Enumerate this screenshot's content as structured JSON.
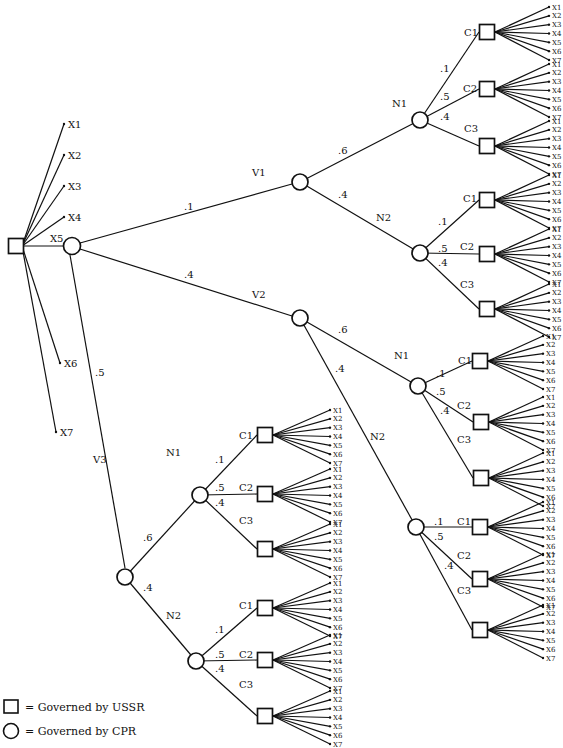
{
  "diagram": {
    "type": "decision-tree",
    "root": {
      "shape": "square",
      "governed_by": "USSR",
      "branches_to_outcomes": [
        "X1",
        "X2",
        "X3",
        "X4",
        "X6",
        "X7"
      ],
      "x5_label": "X5"
    },
    "level1_circle": {
      "shape": "circle",
      "governed_by": "CPR"
    },
    "v_branches": [
      {
        "label": "V1",
        "prob": ".1",
        "n_branches": [
          {
            "label": "N1",
            "prob": ".6",
            "c_branches": [
              {
                "label": "C1",
                "prob": ".1",
                "outcomes": [
                  "X1",
                  "X2",
                  "X3",
                  "X4",
                  "X5",
                  "X6",
                  "X7"
                ]
              },
              {
                "label": "C2",
                "prob": ".5",
                "outcomes": [
                  "X1",
                  "X2",
                  "X3",
                  "X4",
                  "X5",
                  "X6",
                  "X7"
                ]
              },
              {
                "label": "C3",
                "prob": ".4",
                "outcomes": [
                  "X1",
                  "X2",
                  "X3",
                  "X4",
                  "X5",
                  "X6",
                  "X7"
                ]
              }
            ]
          },
          {
            "label": "N2",
            "prob": ".4",
            "c_branches": [
              {
                "label": "C1",
                "prob": ".1",
                "outcomes": [
                  "X1",
                  "X2",
                  "X3",
                  "X4",
                  "X5",
                  "X6",
                  "X7"
                ]
              },
              {
                "label": "C2",
                "prob": ".5",
                "outcomes": [
                  "X1",
                  "X2",
                  "X3",
                  "X4",
                  "X5",
                  "X6",
                  "X7"
                ]
              },
              {
                "label": "C3",
                "prob": ".4",
                "outcomes": [
                  "X1",
                  "X2",
                  "X3",
                  "X4",
                  "X5",
                  "X6",
                  "X7"
                ]
              }
            ]
          }
        ]
      },
      {
        "label": "V2",
        "prob": ".4",
        "n_branches": [
          {
            "label": "N1",
            "prob": ".6",
            "c_branches": [
              {
                "label": "C1",
                "prob": ".1",
                "outcomes": [
                  "X1",
                  "X2",
                  "X3",
                  "X4",
                  "X5",
                  "X6",
                  "X7"
                ]
              },
              {
                "label": "C2",
                "prob": ".5",
                "outcomes": [
                  "X1",
                  "X2",
                  "X3",
                  "X4",
                  "X5",
                  "X6",
                  "X7"
                ]
              },
              {
                "label": "C3",
                "prob": ".4",
                "outcomes": [
                  "X1",
                  "X2",
                  "X3",
                  "X4",
                  "X5",
                  "X6",
                  "X7"
                ]
              }
            ]
          },
          {
            "label": "N2",
            "prob": ".4",
            "c_branches": [
              {
                "label": "C1",
                "prob": ".1",
                "outcomes": [
                  "X1",
                  "X2",
                  "X3",
                  "X4",
                  "X5",
                  "X6",
                  "X7"
                ]
              },
              {
                "label": "C2",
                "prob": ".5",
                "outcomes": [
                  "X1",
                  "X2",
                  "X3",
                  "X4",
                  "X5",
                  "X6",
                  "X7"
                ]
              },
              {
                "label": "C3",
                "prob": ".4",
                "outcomes": [
                  "X1",
                  "X2",
                  "X3",
                  "X4",
                  "X5",
                  "X6",
                  "X7"
                ]
              }
            ]
          }
        ]
      },
      {
        "label": "V3",
        "prob": ".5",
        "n_branches": [
          {
            "label": "N1",
            "prob": ".6",
            "c_branches": [
              {
                "label": "C1",
                "prob": ".1",
                "outcomes": [
                  "X1",
                  "X2",
                  "X3",
                  "X4",
                  "X5",
                  "X6",
                  "X7"
                ]
              },
              {
                "label": "C2",
                "prob": ".5",
                "outcomes": [
                  "X1",
                  "X2",
                  "X3",
                  "X4",
                  "X5",
                  "X6",
                  "X7"
                ]
              },
              {
                "label": "C3",
                "prob": ".4",
                "outcomes": [
                  "X1",
                  "X2",
                  "X3",
                  "X4",
                  "X5",
                  "X6",
                  "X7"
                ]
              }
            ]
          },
          {
            "label": "N2",
            "prob": ".4",
            "c_branches": [
              {
                "label": "C1",
                "prob": ".1",
                "outcomes": [
                  "X1",
                  "X2",
                  "X3",
                  "X4",
                  "X5",
                  "X6",
                  "X7"
                ]
              },
              {
                "label": "C2",
                "prob": ".5",
                "outcomes": [
                  "X1",
                  "X2",
                  "X3",
                  "X4",
                  "X5",
                  "X6",
                  "X7"
                ]
              },
              {
                "label": "C3",
                "prob": ".4",
                "outcomes": [
                  "X1",
                  "X2",
                  "X3",
                  "X4",
                  "X5",
                  "X6",
                  "X7"
                ]
              }
            ]
          }
        ]
      }
    ]
  },
  "legend": {
    "square": "= Governed by USSR",
    "circle": "= Governed by CPR"
  }
}
